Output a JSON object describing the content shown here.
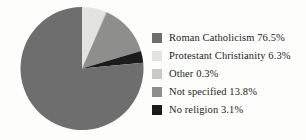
{
  "chart_data": {
    "type": "pie",
    "title": "",
    "subtitle": "",
    "xlabel": "",
    "ylabel": "",
    "grid": false,
    "legend_position": "right",
    "start_angle_deg": 0,
    "direction": "clockwise",
    "units": "percent",
    "total": 100.0,
    "categories": [
      "Roman Catholicism",
      "Protestant Christianity",
      "Other",
      "Not specified",
      "No religion"
    ],
    "values": [
      76.5,
      6.3,
      0.3,
      13.8,
      3.1
    ],
    "value_labels": [
      "76.5%",
      "6.3%",
      "0.3%",
      "13.8%",
      "3.1%"
    ],
    "colors": [
      "#6e6e6e",
      "#e3e3e1",
      "#c9c9c7",
      "#8e8e8d",
      "#1c1c1c"
    ],
    "slices": [
      {
        "label": "Roman Catholicism",
        "value": 76.5,
        "value_label": "76.5%",
        "color": "#6e6e6e",
        "legend_text": "Roman Catholicism 76.5%"
      },
      {
        "label": "Protestant Christianity",
        "value": 6.3,
        "value_label": "6.3%",
        "color": "#e3e3e1",
        "legend_text": "Protestant Christianity 6.3%"
      },
      {
        "label": "Other",
        "value": 0.3,
        "value_label": "0.3%",
        "color": "#c9c9c7",
        "legend_text": "Other 0.3%"
      },
      {
        "label": "Not specified",
        "value": 13.8,
        "value_label": "13.8%",
        "color": "#8e8e8d",
        "legend_text": "Not specified 13.8%"
      },
      {
        "label": "No religion",
        "value": 3.1,
        "value_label": "3.1%",
        "color": "#1c1c1c",
        "legend_text": "No religion 3.1%"
      }
    ]
  },
  "legend": {
    "rows": [
      {
        "text": "Roman Catholicism 76.5%",
        "color": "#6e6e6e"
      },
      {
        "text": "Protestant Christianity 6.3%",
        "color": "#e3e3e1"
      },
      {
        "text": "Other 0.3%",
        "color": "#c9c9c7"
      },
      {
        "text": "Not specified 13.8%",
        "color": "#8e8e8d"
      },
      {
        "text": "No religion 3.1%",
        "color": "#1c1c1c"
      }
    ]
  },
  "style": {
    "background": "#fdfdfc",
    "text_color": "#231f20"
  }
}
